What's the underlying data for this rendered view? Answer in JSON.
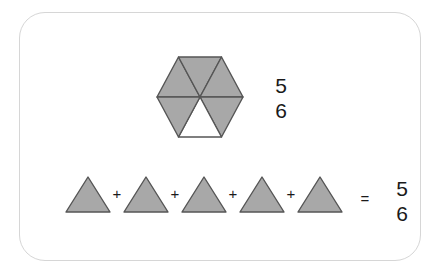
{
  "canvas": {
    "width": 442,
    "height": 275,
    "background": "#ffffff"
  },
  "card": {
    "border_color": "#d6d6d6",
    "background": "#ffffff",
    "radius": 26
  },
  "colors": {
    "shaded_fill": "#a8a8a8",
    "unshaded_fill": "#ffffff",
    "stroke": "#555555",
    "text": "#1a1a1a",
    "card_border": "#d6d6d6",
    "page_background": "#ffffff"
  },
  "diagram": {
    "hexagon": {
      "total_parts": 6,
      "shaded_parts": 5,
      "unshaded_parts": 1,
      "orientation": "flat-top",
      "center": {
        "x": 200,
        "y": 97
      },
      "width": 86,
      "height": 80,
      "sections": [
        {
          "index": 0,
          "position": "top-left",
          "shaded": true
        },
        {
          "index": 1,
          "position": "top-right",
          "shaded": true
        },
        {
          "index": 2,
          "position": "right",
          "shaded": true
        },
        {
          "index": 3,
          "position": "bottom-right",
          "shaded": false
        },
        {
          "index": 4,
          "position": "bottom-left",
          "shaded": true
        },
        {
          "index": 5,
          "position": "left",
          "shaded": true
        }
      ]
    },
    "hexagon_fraction": {
      "numerator": "5",
      "denominator": "6"
    },
    "equation": {
      "terms": [
        {
          "index": 0,
          "shape": "triangle",
          "shaded": true
        },
        {
          "index": 1,
          "shape": "triangle",
          "shaded": true
        },
        {
          "index": 2,
          "shape": "triangle",
          "shaded": true
        },
        {
          "index": 3,
          "shape": "triangle",
          "shaded": true
        },
        {
          "index": 4,
          "shape": "triangle",
          "shaded": true
        }
      ],
      "plus_operators": [
        "+",
        "+",
        "+",
        "+"
      ],
      "equals_operator": "=",
      "result_fraction": {
        "numerator": "5",
        "denominator": "6"
      },
      "triangle_count": 5,
      "triangle_width": 44,
      "triangle_height": 35
    }
  }
}
